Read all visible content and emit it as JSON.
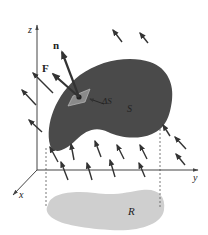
{
  "figure": {
    "labels": {
      "z_axis": "z",
      "y_axis": "y",
      "x_axis": "x",
      "normal": "n",
      "field": "F",
      "area_element": "ΔS",
      "surface": "S",
      "region": "R"
    },
    "colors": {
      "surface": "#4a4a4a",
      "region": "#cfcfcf",
      "arrows": "#333333",
      "axes": "#444444",
      "patch": "#8a8a8a"
    }
  }
}
